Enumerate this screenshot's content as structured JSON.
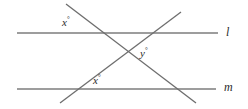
{
  "figure": {
    "type": "geometry-diagram",
    "background_color": "#ffffff",
    "line_color": "#7c7c7c",
    "label_color": "#2b2b2b",
    "degree_symbol": "°",
    "parallel_lines": [
      {
        "id": "line-l",
        "label": "l",
        "x1": 17,
        "y1": 33,
        "x2": 218,
        "y2": 33
      },
      {
        "id": "line-m",
        "label": "m",
        "x1": 17,
        "y1": 89,
        "x2": 216,
        "y2": 89
      }
    ],
    "transversals": [
      {
        "id": "transversal-descending",
        "direction": "down-right",
        "x1": 66,
        "y1": 4,
        "x2": 196,
        "y2": 103
      },
      {
        "id": "transversal-ascending",
        "direction": "up-right",
        "x1": 60,
        "y1": 103,
        "x2": 181,
        "y2": 12
      }
    ],
    "angle_labels": [
      {
        "id": "angle-x-top",
        "variable": "x",
        "text": "x"
      },
      {
        "id": "angle-y-middle",
        "variable": "y",
        "text": "y"
      },
      {
        "id": "angle-x-bottom",
        "variable": "x",
        "text": "x"
      }
    ],
    "line_labels": [
      {
        "id": "label-l",
        "text": "l"
      },
      {
        "id": "label-m",
        "text": "m"
      }
    ]
  }
}
